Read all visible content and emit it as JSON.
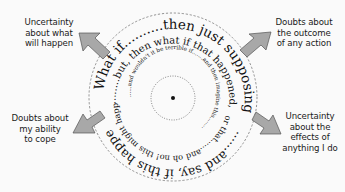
{
  "diagram": {
    "center_label": "",
    "spiral": {
      "outer_ring_top": "What if..........then just supposing",
      "outer_ring_bottom": "......and say, if this happened",
      "ring2_top": "........but, then what if that happened,",
      "ring2_bottom": "or that......and oh no! this might happen or this or this",
      "ring3": "......and wouldn't it be terrible if.......and then imagine this........",
      "ring4": "............"
    },
    "callouts": [
      {
        "id": "top-left",
        "text": "Uncertainty\nabout what\nwill happen"
      },
      {
        "id": "top-right",
        "text": "Doubts about\nthe outcome\nof any action"
      },
      {
        "id": "bottom-left",
        "text": "Doubts about\nmy ability\nto cope"
      },
      {
        "id": "bottom-right",
        "text": "Uncertainty\nabout the\neffects of\nanything I do"
      }
    ],
    "colors": {
      "arrow_fill": "#a8a8a8",
      "arrow_stroke": "#555555",
      "dashed_circle": "#777777",
      "text": "#111111",
      "background": "#fafafa"
    }
  }
}
